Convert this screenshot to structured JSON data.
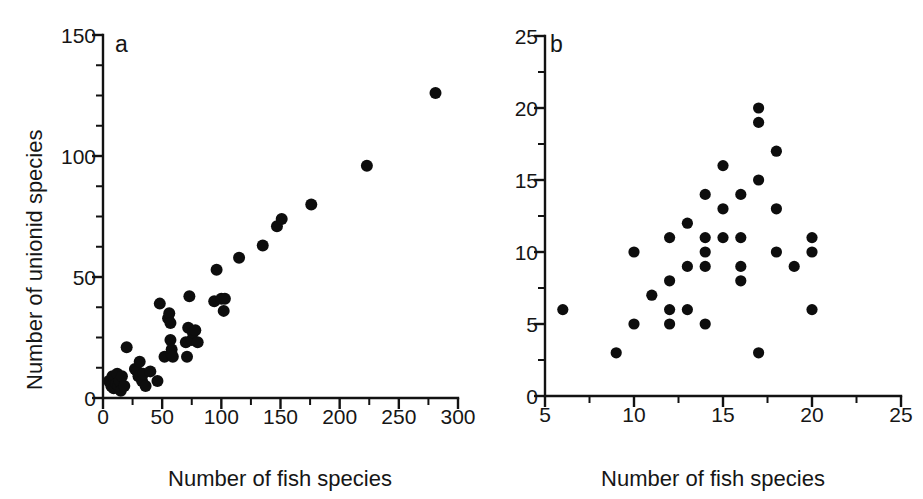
{
  "figure": {
    "background_color": "#ffffff",
    "marker_color": "#0d0d0d",
    "axis_color": "#121212"
  },
  "chart_data": [
    {
      "type": "scatter",
      "panel_label": "a",
      "title": "",
      "xlabel": "Number of fish species",
      "ylabel": "Number of unionid species",
      "xlim": [
        0,
        300
      ],
      "ylim": [
        0,
        150
      ],
      "xticks": [
        0,
        50,
        100,
        150,
        200,
        250,
        300
      ],
      "xtick_labels": [
        "0",
        "50",
        "100",
        "150",
        "200",
        "250",
        "300"
      ],
      "yticks": [
        0,
        50,
        100,
        150
      ],
      "ytick_labels": [
        "0",
        "50",
        "100",
        "150"
      ],
      "x_minor_tick_interval": 25,
      "y_minor_tick_interval": 12.5,
      "grid": false,
      "legend": false,
      "points": [
        [
          5,
          7
        ],
        [
          7,
          5
        ],
        [
          8,
          9
        ],
        [
          9,
          4
        ],
        [
          10,
          8
        ],
        [
          11,
          6
        ],
        [
          12,
          10
        ],
        [
          13,
          5
        ],
        [
          14,
          7
        ],
        [
          15,
          3
        ],
        [
          16,
          9
        ],
        [
          18,
          5
        ],
        [
          20,
          21
        ],
        [
          27,
          12
        ],
        [
          29,
          11
        ],
        [
          30,
          9
        ],
        [
          31,
          15
        ],
        [
          33,
          7
        ],
        [
          34,
          10
        ],
        [
          36,
          5
        ],
        [
          40,
          11
        ],
        [
          46,
          7
        ],
        [
          48,
          39
        ],
        [
          52,
          17
        ],
        [
          55,
          33
        ],
        [
          56,
          35
        ],
        [
          57,
          31
        ],
        [
          57,
          24
        ],
        [
          58,
          18
        ],
        [
          58,
          20
        ],
        [
          59,
          17
        ],
        [
          70,
          23
        ],
        [
          71,
          17
        ],
        [
          72,
          29
        ],
        [
          73,
          42
        ],
        [
          75,
          24
        ],
        [
          76,
          27
        ],
        [
          78,
          28
        ],
        [
          80,
          23
        ],
        [
          94,
          40
        ],
        [
          96,
          53
        ],
        [
          100,
          41
        ],
        [
          102,
          36
        ],
        [
          103,
          41
        ],
        [
          115,
          58
        ],
        [
          135,
          63
        ],
        [
          147,
          71
        ],
        [
          151,
          74
        ],
        [
          176,
          80
        ],
        [
          223,
          96
        ],
        [
          281,
          126
        ]
      ]
    },
    {
      "type": "scatter",
      "panel_label": "b",
      "title": "",
      "xlabel": "Number of fish species",
      "ylabel": "",
      "xlim": [
        5,
        25
      ],
      "ylim": [
        0,
        25
      ],
      "xticks": [
        5,
        10,
        15,
        20,
        25
      ],
      "xtick_labels": [
        "5",
        "10",
        "15",
        "20",
        "25"
      ],
      "yticks": [
        0,
        5,
        10,
        15,
        20,
        25
      ],
      "ytick_labels": [
        "0",
        "5",
        "10",
        "15",
        "20",
        "25"
      ],
      "x_minor_tick_interval": 2.5,
      "y_minor_tick_interval": 2.5,
      "grid": false,
      "legend": false,
      "points": [
        [
          6,
          6
        ],
        [
          9,
          3
        ],
        [
          10,
          10
        ],
        [
          10,
          5
        ],
        [
          11,
          7
        ],
        [
          12,
          11
        ],
        [
          12,
          8
        ],
        [
          12,
          6
        ],
        [
          12,
          5
        ],
        [
          13,
          12
        ],
        [
          13,
          9
        ],
        [
          13,
          6
        ],
        [
          14,
          14
        ],
        [
          14,
          11
        ],
        [
          14,
          10
        ],
        [
          14,
          9
        ],
        [
          14,
          5
        ],
        [
          15,
          16
        ],
        [
          15,
          13
        ],
        [
          15,
          11
        ],
        [
          16,
          14
        ],
        [
          16,
          11
        ],
        [
          16,
          9
        ],
        [
          16,
          8
        ],
        [
          17,
          20
        ],
        [
          17,
          19
        ],
        [
          17,
          15
        ],
        [
          17,
          3
        ],
        [
          18,
          17
        ],
        [
          18,
          13
        ],
        [
          18,
          10
        ],
        [
          19,
          9
        ],
        [
          20,
          11
        ],
        [
          20,
          10
        ],
        [
          20,
          6
        ]
      ]
    }
  ]
}
